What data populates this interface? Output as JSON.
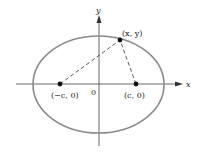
{
  "diagram": {
    "type": "ellipse-foci",
    "axes": {
      "x_label": "x",
      "y_label": "y",
      "origin_label": "0"
    },
    "points": {
      "left_focus": "(−c, 0)",
      "right_focus": "(c, 0)",
      "point_on_ellipse": "(x, y)"
    },
    "colors": {
      "ellipse": "#8a8a8a",
      "axes": "#555555",
      "points": "#111111",
      "dashes": "#333333"
    }
  }
}
